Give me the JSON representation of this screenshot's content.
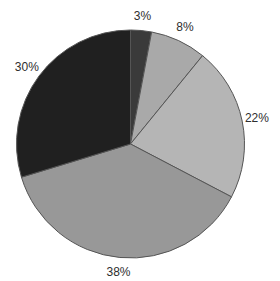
{
  "chart_data": {
    "type": "pie",
    "title": "",
    "labels": [
      "3%",
      "8%",
      "22%",
      "38%",
      "30%"
    ],
    "values": [
      3,
      8,
      22,
      38,
      30
    ],
    "start_angle_deg": 0,
    "direction": "clockwise",
    "slice_colors": [
      "#3a3a3a",
      "#a9a9a9",
      "#b5b5b5",
      "#989898",
      "#202020"
    ],
    "outline_color": "#555555",
    "label_color": "#2e2e2e",
    "background": "#ffffff",
    "legend": "none",
    "labels_position": "outside"
  }
}
